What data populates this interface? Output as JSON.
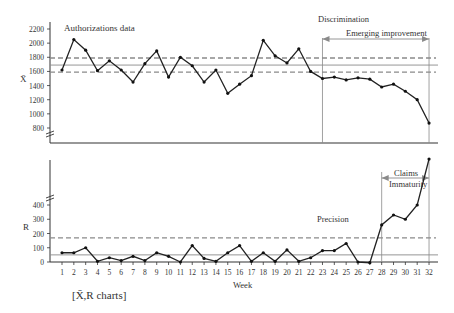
{
  "chart_data": [
    {
      "type": "line",
      "title": "Authorizations data",
      "ylabel": "X̄",
      "xlabel": "Week",
      "ylim": [
        800,
        2200
      ],
      "yticks": [
        800,
        1000,
        1200,
        1400,
        1600,
        1800,
        2000,
        2200
      ],
      "x": [
        1,
        2,
        3,
        4,
        5,
        6,
        7,
        8,
        9,
        10,
        11,
        12,
        13,
        14,
        15,
        16,
        17,
        18,
        19,
        20,
        21,
        22,
        23,
        24,
        25,
        26,
        27,
        28,
        29,
        30,
        31,
        32
      ],
      "series": [
        {
          "name": "X-bar",
          "values": [
            1620,
            2050,
            1900,
            1610,
            1750,
            1620,
            1450,
            1710,
            1890,
            1520,
            1800,
            1680,
            1450,
            1620,
            1290,
            1420,
            1540,
            2040,
            1820,
            1720,
            1920,
            1600,
            1500,
            1520,
            1480,
            1510,
            1490,
            1380,
            1420,
            1320,
            1200,
            870
          ]
        }
      ],
      "control_lines": {
        "ucl": 1790,
        "center": 1690,
        "lcl": 1590
      },
      "annotations": [
        {
          "text": "Discrimination"
        },
        {
          "text": "Emerging improvement",
          "from_week": 23,
          "to_week": 32
        }
      ],
      "axis_break": true,
      "grid": false
    },
    {
      "type": "line",
      "title": "Precision",
      "ylabel": "R",
      "xlabel": "Week",
      "ylim": [
        0,
        400
      ],
      "yticks": [
        0,
        100,
        200,
        300,
        400
      ],
      "x": [
        1,
        2,
        3,
        4,
        5,
        6,
        7,
        8,
        9,
        10,
        11,
        12,
        13,
        14,
        15,
        16,
        17,
        18,
        19,
        20,
        21,
        22,
        23,
        24,
        25,
        26,
        27,
        28,
        29,
        30,
        31,
        32
      ],
      "series": [
        {
          "name": "R",
          "values": [
            65,
            65,
            100,
            5,
            30,
            10,
            40,
            10,
            65,
            40,
            0,
            115,
            25,
            5,
            65,
            115,
            5,
            65,
            5,
            85,
            5,
            30,
            80,
            80,
            130,
            0,
            -5,
            260,
            330,
            300,
            400,
            730
          ]
        }
      ],
      "control_lines": {
        "ucl": 170,
        "center": 50
      },
      "annotations": [
        {
          "text": "Claims Immaturity",
          "from_week": 28,
          "to_week": 32
        }
      ],
      "axis_break": true,
      "grid": false
    }
  ],
  "labels": {
    "top_title": "Authorizations data",
    "top_ylabel": "X̄",
    "discrimination": "Discrimination",
    "emerging": "Emerging improvement",
    "claims_line1": "Claims",
    "claims_line2": "Immaturity",
    "precision": "Precision",
    "bottom_ylabel": "R",
    "xlabel": "Week",
    "caption": "[X̄,R charts]"
  },
  "colors": {
    "line": "#222222",
    "control": "#8a8a8a",
    "axis": "#333333",
    "marker": "#111111"
  }
}
